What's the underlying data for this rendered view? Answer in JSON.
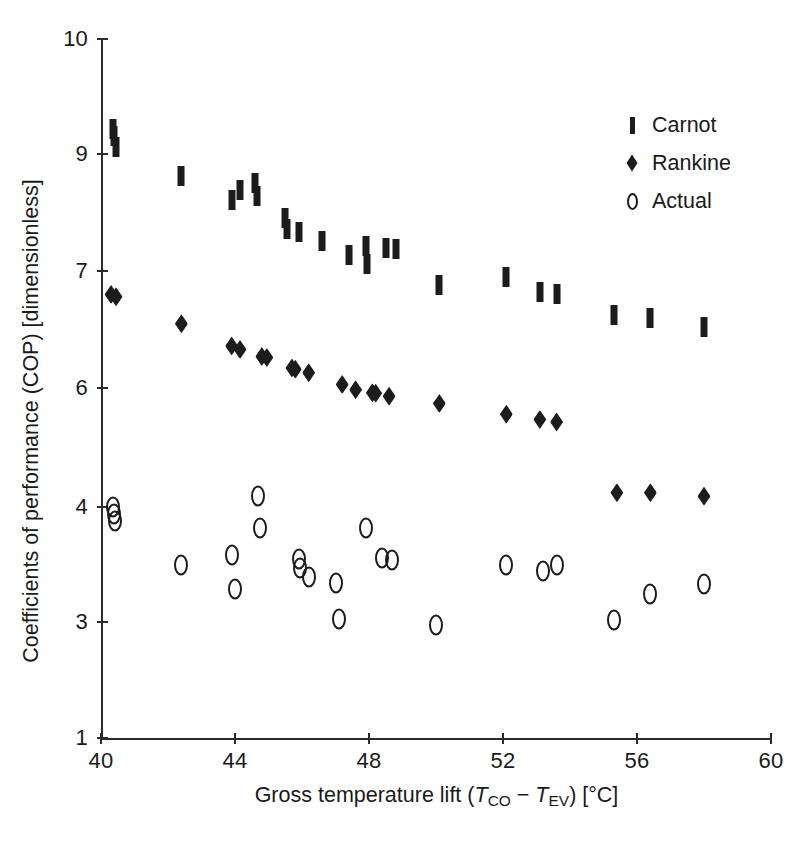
{
  "chart_data": {
    "type": "scatter",
    "title": "",
    "xlabel": "Gross temperature lift (T_CO − T_EV) [°C]",
    "ylabel": "Coefficients of performance (COP) [dimensionless]",
    "xlim": [
      40,
      60
    ],
    "ylim": [
      1,
      10
    ],
    "grid": false,
    "legend_position": "top-right",
    "xticks": [
      40,
      44,
      48,
      52,
      56,
      60
    ],
    "yticks": [
      1,
      3,
      4,
      6,
      7,
      9,
      10
    ],
    "y_axis_note": "non-uniform tick spacing: 1,3,4,6,7,9,10 are drawn at equal-ish pixel intervals",
    "series": [
      {
        "name": "Carnot",
        "marker": "vertical-bar",
        "color": "#1c1c1c",
        "points": [
          [
            40.35,
            9.22
          ],
          [
            40.38,
            9.16
          ],
          [
            40.45,
            9.06
          ],
          [
            42.4,
            8.62
          ],
          [
            43.9,
            8.22
          ],
          [
            44.15,
            8.38
          ],
          [
            44.6,
            8.5
          ],
          [
            44.65,
            8.28
          ],
          [
            45.5,
            7.9
          ],
          [
            45.55,
            7.72
          ],
          [
            45.9,
            7.66
          ],
          [
            46.6,
            7.52
          ],
          [
            47.4,
            7.28
          ],
          [
            47.9,
            7.42
          ],
          [
            47.95,
            7.12
          ],
          [
            48.5,
            7.4
          ],
          [
            48.8,
            7.38
          ],
          [
            50.1,
            6.88
          ],
          [
            52.1,
            6.95
          ],
          [
            53.1,
            6.82
          ],
          [
            53.6,
            6.8
          ],
          [
            55.3,
            6.62
          ],
          [
            56.4,
            6.6
          ],
          [
            58.0,
            6.52
          ]
        ]
      },
      {
        "name": "Rankine",
        "marker": "diamond",
        "color": "#1c1c1c",
        "points": [
          [
            40.3,
            6.8
          ],
          [
            40.45,
            6.78
          ],
          [
            42.4,
            6.55
          ],
          [
            43.9,
            6.36
          ],
          [
            44.15,
            6.33
          ],
          [
            44.8,
            6.27
          ],
          [
            44.95,
            6.26
          ],
          [
            45.7,
            6.17
          ],
          [
            45.8,
            6.16
          ],
          [
            46.2,
            6.13
          ],
          [
            47.2,
            6.03
          ],
          [
            47.6,
            5.97
          ],
          [
            48.1,
            5.92
          ],
          [
            48.2,
            5.91
          ],
          [
            48.6,
            5.86
          ],
          [
            50.1,
            5.74
          ],
          [
            52.1,
            5.56
          ],
          [
            53.1,
            5.47
          ],
          [
            53.6,
            5.43
          ],
          [
            55.4,
            4.24
          ],
          [
            56.4,
            4.24
          ],
          [
            58.0,
            4.18
          ]
        ]
      },
      {
        "name": "Actual",
        "marker": "open-circle",
        "color": "#1c1c1c",
        "points": [
          [
            40.35,
            4.0
          ],
          [
            40.38,
            3.94
          ],
          [
            40.42,
            3.88
          ],
          [
            42.4,
            3.5
          ],
          [
            43.9,
            3.58
          ],
          [
            44.0,
            3.29
          ],
          [
            44.7,
            4.18
          ],
          [
            44.75,
            3.82
          ],
          [
            45.9,
            3.55
          ],
          [
            45.95,
            3.47
          ],
          [
            46.2,
            3.39
          ],
          [
            47.0,
            3.34
          ],
          [
            47.1,
            3.03
          ],
          [
            47.9,
            3.82
          ],
          [
            48.4,
            3.56
          ],
          [
            48.7,
            3.54
          ],
          [
            50.0,
            2.95
          ],
          [
            52.1,
            3.5
          ],
          [
            53.2,
            3.44
          ],
          [
            53.6,
            3.5
          ],
          [
            55.3,
            3.02
          ],
          [
            56.4,
            3.24
          ],
          [
            58.0,
            3.33
          ]
        ]
      }
    ]
  },
  "axes": {
    "x": {
      "ticks": [
        {
          "value": 40,
          "label": "40"
        },
        {
          "value": 44,
          "label": "44"
        },
        {
          "value": 48,
          "label": "48"
        },
        {
          "value": 52,
          "label": "52"
        },
        {
          "value": 56,
          "label": "56"
        },
        {
          "value": 60,
          "label": "60"
        }
      ]
    },
    "y": {
      "ticks": [
        {
          "value": 10,
          "label": "10"
        },
        {
          "value": 9,
          "label": "9"
        },
        {
          "value": 7,
          "label": "7"
        },
        {
          "value": 6,
          "label": "6"
        },
        {
          "value": 4,
          "label": "4"
        },
        {
          "value": 3,
          "label": "3"
        },
        {
          "value": 1,
          "label": "1"
        }
      ]
    }
  },
  "labels": {
    "x_prefix": "Gross temperature lift (",
    "x_var1": "T",
    "x_var1_sub": "CO",
    "x_minus": " − ",
    "x_var2": "T",
    "x_var2_sub": "EV",
    "x_suffix": ") [°C]",
    "y_title": "Coefficients of performance (COP) [dimensionless]"
  },
  "legend": {
    "entries": [
      {
        "label": "Carnot",
        "marker": "vertical-bar"
      },
      {
        "label": "Rankine",
        "marker": "diamond"
      },
      {
        "label": "Actual",
        "marker": "open-circle"
      }
    ]
  },
  "colors": {
    "ink": "#1c1c1c",
    "axis": "#2b2b2b",
    "background": "#ffffff"
  }
}
